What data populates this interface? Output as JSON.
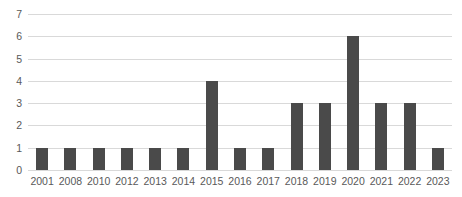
{
  "chart_data": {
    "type": "bar",
    "title": "",
    "subtitle": "",
    "xlabel": "",
    "ylabel": "",
    "categories": [
      "2001",
      "2008",
      "2010",
      "2012",
      "2013",
      "2014",
      "2015",
      "2016",
      "2017",
      "2018",
      "2019",
      "2020",
      "2021",
      "2022",
      "2023"
    ],
    "values": [
      1,
      1,
      1,
      1,
      1,
      1,
      4,
      1,
      1,
      3,
      3,
      6,
      3,
      3,
      1
    ],
    "series": [
      {
        "name": "",
        "values": [
          1,
          1,
          1,
          1,
          1,
          1,
          4,
          1,
          1,
          3,
          3,
          6,
          3,
          3,
          1
        ]
      }
    ],
    "ylim": [
      0,
      7
    ],
    "y_ticks": [
      0,
      1,
      2,
      3,
      4,
      5,
      6,
      7
    ],
    "y_tick_labels": [
      "0",
      "1",
      "2",
      "3",
      "4",
      "5",
      "6",
      "7"
    ],
    "y_tick_step": 1,
    "grid": true,
    "grid_axis": "y",
    "legend": false,
    "legend_position": "none",
    "annotations": [],
    "colors": {
      "bar": "#4a4a4a",
      "gridline": "#d9d9d9",
      "tick_label": "#595959",
      "background": "#ffffff"
    }
  }
}
